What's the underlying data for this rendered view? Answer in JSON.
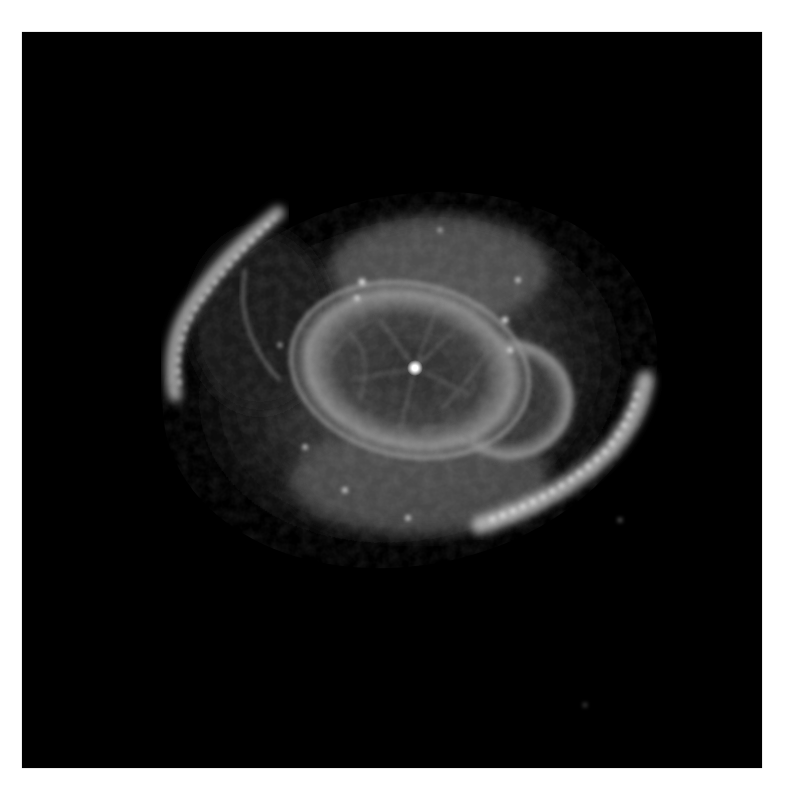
{
  "image": {
    "subject": "planetary nebula",
    "description": "Grayscale astronomical image of a planetary nebula with a bright central star, an inner elliptical shell with filamentary structure, a second overlapping lobe, and fragmented outer arcs.",
    "colors": {
      "page_background": "#ffffff",
      "sky": "#000000",
      "nebula_core": "#9a9a9a",
      "nebula_glow": "#6e6e6e",
      "arc_highlight": "#d8d8d8",
      "central_star": "#ffffff"
    },
    "features": {
      "central_star": {
        "x": 415,
        "y": 368
      },
      "inner_shell": {
        "cx": 410,
        "cy": 370,
        "rx": 125,
        "ry": 88,
        "rotation": 10
      },
      "second_lobe": {
        "cx": 505,
        "cy": 400,
        "rx": 70,
        "ry": 65
      },
      "outer_arc_left": "upper-left fragmented arc from (170,390) to (280,215)",
      "outer_arc_right": "lower-right fragmented arc from (490,525) to (645,380)"
    }
  }
}
